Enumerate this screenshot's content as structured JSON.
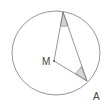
{
  "diagram": {
    "type": "geometry",
    "labels": {
      "center": "M",
      "point_a": "A"
    },
    "colors": {
      "stroke": "#7a7a7a",
      "angle_fill": "#d4d4d4",
      "text": "#444444"
    },
    "points": {
      "M": [
        54,
        61
      ],
      "P": [
        63,
        12
      ],
      "A": [
        87,
        81
      ]
    },
    "circle": {
      "cx": 56,
      "cy": 53,
      "rx": 44,
      "ry": 42
    },
    "shaded_angles": [
      "angle at P (between PM and PA)",
      "angle at A (between AM and AP)"
    ]
  }
}
